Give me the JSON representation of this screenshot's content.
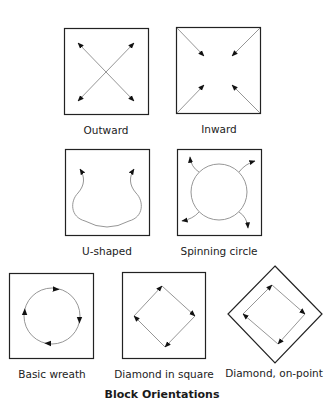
{
  "title": "Block Orientations",
  "diagram": {
    "rows": [
      {
        "items": [
          {
            "id": "outward",
            "label": "Outward"
          },
          {
            "id": "inward",
            "label": "Inward"
          }
        ]
      },
      {
        "items": [
          {
            "id": "u-shaped",
            "label": "U-shaped"
          },
          {
            "id": "spinning-circle",
            "label": "Spinning circle"
          }
        ]
      },
      {
        "items": [
          {
            "id": "basic-wreath",
            "label": "Basic wreath"
          },
          {
            "id": "diamond-in-square",
            "label": "Diamond in square"
          },
          {
            "id": "diamond-on-point",
            "label": "Diamond, on-point"
          }
        ]
      }
    ],
    "colors": {
      "frame": "#222222",
      "arrow_line": "#8a8a8a",
      "arrow_head": "#111111"
    }
  }
}
